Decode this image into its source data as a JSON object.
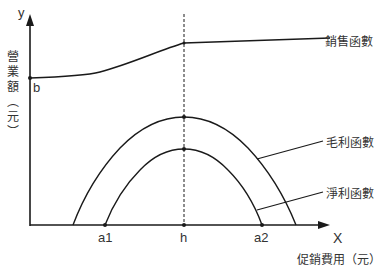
{
  "diagram": {
    "axes": {
      "x_label": "X",
      "y_label": "y",
      "x_title": "促銷費用（元）",
      "y_title_chars": [
        "營",
        "業",
        "額",
        "︵",
        "元",
        "︶"
      ]
    },
    "points": {
      "b": "b",
      "a1": "a1",
      "h": "h",
      "a2": "a2"
    },
    "curves": {
      "sales": "銷售函數",
      "gross_profit": "毛利函數",
      "net_profit": "淨利函數"
    },
    "colors": {
      "line": "#1a1a1a",
      "text": "#333333"
    }
  }
}
